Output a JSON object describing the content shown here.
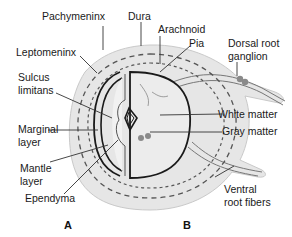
{
  "figure": {
    "panels": [
      {
        "id": "A",
        "label": "A"
      },
      {
        "id": "B",
        "label": "B"
      }
    ],
    "labels": {
      "pachymeninx": "Pachymeninx",
      "dura": "Dura",
      "arachnoid": "Arachnoid",
      "pia": "Pia",
      "leptomeninx": "Leptomeninx",
      "dorsal_root_ganglion_1": "Dorsal root",
      "dorsal_root_ganglion_2": "ganglion",
      "sulcus_limitans_1": "Sulcus",
      "sulcus_limitans_2": "limitans",
      "white_matter": "White matter",
      "gray_matter": "Gray matter",
      "marginal_layer_1": "Marginal",
      "marginal_layer_2": "layer",
      "mantle_layer_1": "Mantle",
      "mantle_layer_2": "layer",
      "ependyma": "Ependyma",
      "ventral_root_fibers_1": "Ventral",
      "ventral_root_fibers_2": "root fibers"
    },
    "colors": {
      "outer_fill": "#e6e6e6",
      "inner_fill": "#eeeeee",
      "line": "#1a1a1a",
      "leader": "#333333",
      "dash": "#555555",
      "ganglion": "#8a8a8a"
    }
  }
}
